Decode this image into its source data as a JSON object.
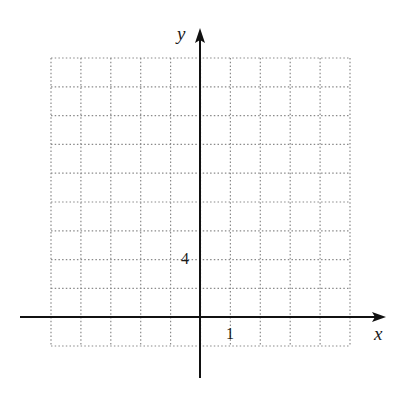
{
  "chart_data": {
    "type": "scatter",
    "title": "",
    "xlabel": "x",
    "ylabel": "y",
    "grid": true,
    "grid_style": "dotted",
    "x_tick_labels": [
      {
        "value": 1,
        "label": "1"
      }
    ],
    "y_tick_labels": [
      {
        "value": 4,
        "label": "4"
      }
    ],
    "x_grid_units": {
      "min": -5,
      "max": 5,
      "step": 1
    },
    "y_grid_units": {
      "min": -4,
      "max": 36,
      "step": 4
    },
    "xlim": [
      -5,
      5
    ],
    "ylim": [
      -4,
      36
    ],
    "series": [],
    "axis_color": "#111111",
    "grid_color": "#888888"
  },
  "labels": {
    "x_axis": "x",
    "y_axis": "y",
    "x_tick": "1",
    "y_tick": "4"
  }
}
